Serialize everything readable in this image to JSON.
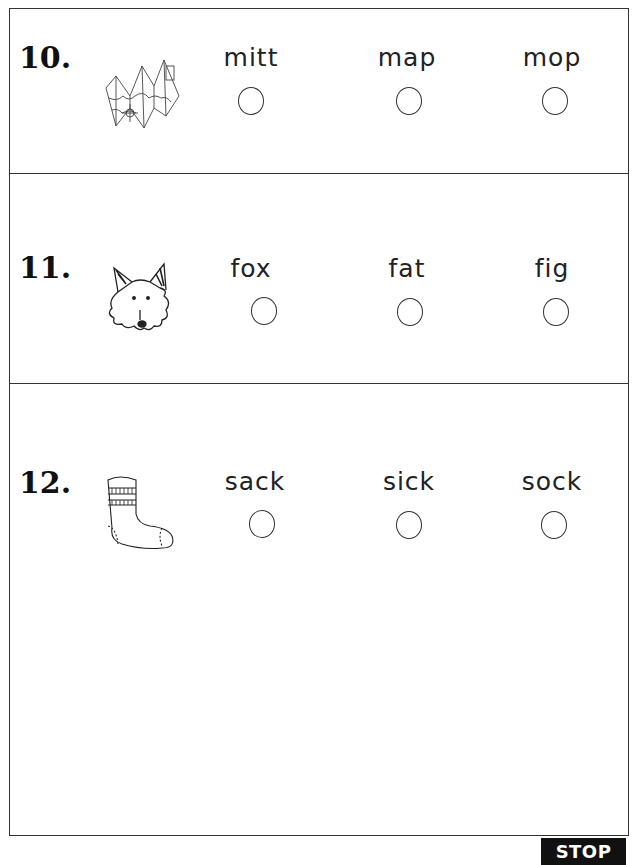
{
  "questions": [
    {
      "number": "10.",
      "picture": "map-icon",
      "options": [
        "mitt",
        "map",
        "mop"
      ]
    },
    {
      "number": "11.",
      "picture": "fox-icon",
      "options": [
        "fox",
        "fat",
        "fig"
      ]
    },
    {
      "number": "12.",
      "picture": "sock-icon",
      "options": [
        "sack",
        "sick",
        "sock"
      ]
    }
  ],
  "footer": {
    "stop_label": "STOP"
  }
}
